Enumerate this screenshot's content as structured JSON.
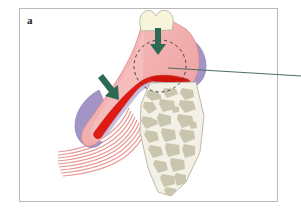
{
  "figure": {
    "panel_label": "a",
    "caption": "",
    "border_color": "#b9b9b9",
    "background": "#ffffff"
  },
  "anatomy": {
    "tooth_crown": {
      "name": "tooth-crown",
      "fill": "#f7f4dc",
      "stroke": "#b0aea0"
    },
    "gingiva": {
      "name": "gingiva",
      "fill": "#f2aeae",
      "stroke": "#e08a8a"
    },
    "gingiva_highlight": {
      "name": "gingiva-highlight",
      "fill": "#f7c6c6"
    },
    "inflammation_band": {
      "name": "inflammation-band",
      "fill": "#e01b13",
      "stroke": "#c01009"
    },
    "epithelial_line": {
      "name": "epithelial-line",
      "fill": "#c3bcdc"
    },
    "periosteum_band": {
      "name": "periosteum-band",
      "fill": "#a294c4",
      "stroke": "#8d7fb3"
    },
    "muscle_fibers": {
      "name": "muscle-fibers",
      "stroke": "#e8918e",
      "count": 9
    },
    "alveolar_bone": {
      "name": "alveolar-bone",
      "fill": "#f3f1e6",
      "stroke": "#b5b2a2",
      "trabecula_fill": "#c9c5ae"
    }
  },
  "annotations": {
    "arrow_color": "#2c6a52",
    "arrows": [
      {
        "name": "arrow-crown-pressure",
        "direction": "down"
      },
      {
        "name": "arrow-vestibular-pressure",
        "direction": "down-right"
      }
    ],
    "dashed_circle": {
      "name": "region-of-interest",
      "stroke": "#333333",
      "dash": "3 3"
    },
    "leader_line": {
      "name": "callout-leader-line",
      "stroke": "#4a6f63"
    }
  }
}
